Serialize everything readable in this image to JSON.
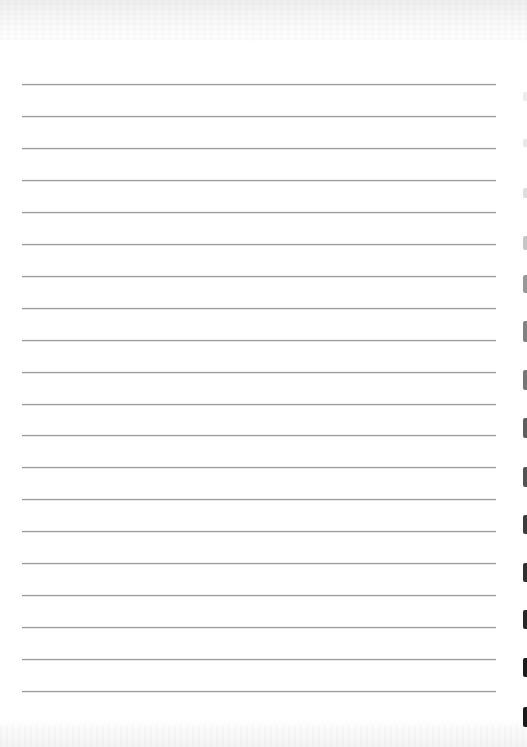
{
  "document": {
    "type": "blank lined paper",
    "background_color": "#ffffff",
    "rule_line_color": "#9c9c9c",
    "rule_lines": {
      "count": 20,
      "left": 22,
      "right": 496,
      "first_y": 84,
      "spacing": 31.95
    },
    "binding_marks": [
      {
        "y": 92,
        "height": 9,
        "opacity": 0.08
      },
      {
        "y": 139,
        "height": 8,
        "opacity": 0.1
      },
      {
        "y": 188,
        "height": 10,
        "opacity": 0.15
      },
      {
        "y": 236,
        "height": 14,
        "opacity": 0.25
      },
      {
        "y": 275,
        "height": 18,
        "opacity": 0.45
      },
      {
        "y": 321,
        "height": 21,
        "opacity": 0.55
      },
      {
        "y": 370,
        "height": 20,
        "opacity": 0.6
      },
      {
        "y": 418,
        "height": 20,
        "opacity": 0.7
      },
      {
        "y": 467,
        "height": 20,
        "opacity": 0.75
      },
      {
        "y": 515,
        "height": 19,
        "opacity": 0.85
      },
      {
        "y": 563,
        "height": 19,
        "opacity": 0.9
      },
      {
        "y": 610,
        "height": 19,
        "opacity": 0.95
      },
      {
        "y": 658,
        "height": 19,
        "opacity": 1.0
      },
      {
        "y": 707,
        "height": 20,
        "opacity": 1.0
      }
    ]
  }
}
